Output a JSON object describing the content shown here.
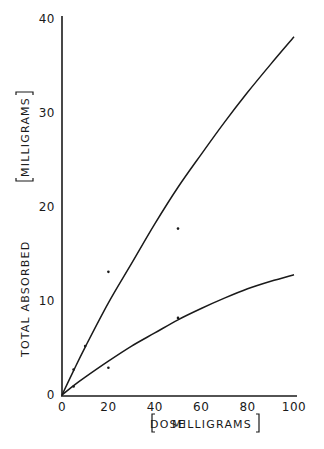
{
  "chart_data": {
    "type": "line",
    "title": "",
    "xlabel": "DOSE [MILLIGRAMS]",
    "ylabel": "TOTAL ABSORBED [MILLIGRAMS]",
    "xlim": [
      0,
      100
    ],
    "ylim": [
      0,
      40
    ],
    "grid": false,
    "legend": null,
    "x_ticks": [
      0,
      20,
      40,
      60,
      80,
      100
    ],
    "x_tick_labels": [
      "0",
      "20",
      "40",
      "60",
      "80",
      "100"
    ],
    "y_ticks": [
      0,
      10,
      20,
      30,
      40
    ],
    "y_tick_labels": [
      "0",
      "10",
      "20",
      "30",
      "40"
    ],
    "series": [
      {
        "name": "upper fitted curve",
        "kind": "line",
        "x": [
          0,
          5,
          10,
          20,
          30,
          40,
          50,
          60,
          70,
          80,
          90,
          100
        ],
        "values": [
          0,
          2.6,
          5.1,
          9.8,
          14.0,
          18.2,
          22.1,
          25.6,
          29.0,
          32.2,
          35.2,
          38.1
        ]
      },
      {
        "name": "lower fitted curve",
        "kind": "line",
        "x": [
          0,
          5,
          10,
          20,
          30,
          40,
          50,
          60,
          70,
          80,
          90,
          100
        ],
        "values": [
          0,
          1.0,
          1.9,
          3.6,
          5.2,
          6.6,
          8.0,
          9.2,
          10.3,
          11.3,
          12.1,
          12.8
        ]
      },
      {
        "name": "measured points",
        "kind": "scatter",
        "x": [
          5,
          10,
          20,
          50,
          5,
          20,
          50
        ],
        "values": [
          2.7,
          5.2,
          13.1,
          17.7,
          0.9,
          2.9,
          8.2
        ]
      }
    ]
  },
  "labels": {
    "xlabel_main": "DOSE",
    "xlabel_unit": "MILLIGRAMS",
    "ylabel_main": "TOTAL ABSORBED",
    "ylabel_unit": "MILLIGRAMS"
  }
}
